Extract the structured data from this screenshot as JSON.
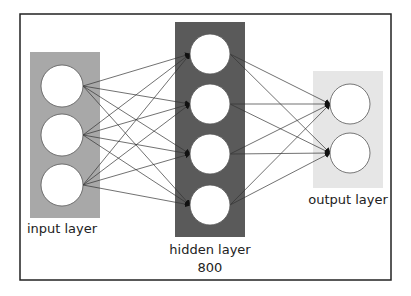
{
  "diagram": {
    "type": "neural-network",
    "frame": {
      "x": 20,
      "y": 14,
      "width": 371,
      "height": 266,
      "stroke": "#222222"
    },
    "layers": [
      {
        "id": "input",
        "label": "input layer",
        "box": {
          "x": 30,
          "y": 52,
          "width": 70,
          "height": 166,
          "fill": "#a8a8a8"
        },
        "node_cx": 62,
        "node_r": 21,
        "nodes_cy": [
          86,
          135,
          185
        ],
        "label_pos": {
          "x": 62,
          "y": 233
        }
      },
      {
        "id": "hidden",
        "label": "hidden layer",
        "sublabel": "800",
        "box": {
          "x": 175,
          "y": 22,
          "width": 70,
          "height": 215,
          "fill": "#5a5a5a"
        },
        "node_cx": 210,
        "node_r": 20,
        "nodes_cy": [
          54,
          104,
          154,
          205
        ],
        "label_pos": {
          "x": 210,
          "y": 254
        },
        "sublabel_pos": {
          "x": 210,
          "y": 272
        }
      },
      {
        "id": "output",
        "label": "output layer",
        "box": {
          "x": 313,
          "y": 71,
          "width": 70,
          "height": 117,
          "fill": "#e6e6e6"
        },
        "node_cx": 350,
        "node_r": 20,
        "nodes_cy": [
          104,
          153
        ],
        "label_pos": {
          "x": 348,
          "y": 204
        }
      }
    ],
    "edge_color": "#333333",
    "node_fill": "#ffffff",
    "node_stroke": "#555555"
  }
}
